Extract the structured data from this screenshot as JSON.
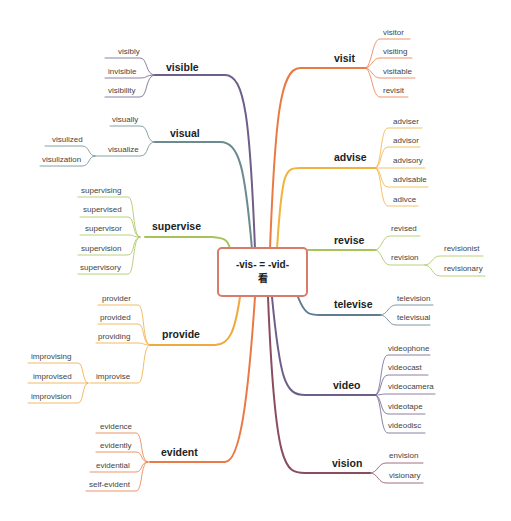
{
  "center": {
    "line1": "-vis- = -vid-",
    "line2": "看"
  },
  "colors": {
    "visible": "#6e5f8a",
    "visual": "#6b8b8f",
    "supervise": "#a6c45a",
    "provide": "#f0a93e",
    "evident": "#ea7a45",
    "visit": "#ea7a45",
    "advise": "#f0b33e",
    "revise": "#a6c45a",
    "televise": "#5f7d8f",
    "video": "#6e5f8a",
    "vision": "#8a4d5f",
    "center_border": "#d97b6c"
  },
  "left": {
    "visible": {
      "label": "visible",
      "children": [
        "visibly",
        "invisible",
        "visibility"
      ]
    },
    "visual": {
      "label": "visual",
      "children": [
        "visually",
        "visualize"
      ],
      "visualize_children": [
        "visulized",
        "visulization"
      ]
    },
    "supervise": {
      "label": "supervise",
      "children": [
        "supervising",
        "supervised",
        "supervisor",
        "supervision",
        "supervisory"
      ]
    },
    "provide": {
      "label": "provide",
      "children": [
        "provider",
        "provided",
        "providing",
        "improvise"
      ],
      "improvise_children": [
        "improvising",
        "improvised",
        "improvision"
      ]
    },
    "evident": {
      "label": "evident",
      "children": [
        "evidence",
        "evidently",
        "evidential",
        "self-evident"
      ]
    }
  },
  "right": {
    "visit": {
      "label": "visit",
      "children": [
        "visitor",
        "visiting",
        "visitable",
        "revisit"
      ]
    },
    "advise": {
      "label": "advise",
      "children": [
        "adviser",
        "advisor",
        "advisory",
        "advisable",
        "adivce"
      ]
    },
    "revise": {
      "label": "revise",
      "children": [
        "revised",
        "revision"
      ],
      "revision_children": [
        "revisionist",
        "revisionary"
      ]
    },
    "televise": {
      "label": "televise",
      "children": [
        "television",
        "televisual"
      ]
    },
    "video": {
      "label": "video",
      "children": [
        "videophone",
        "videocast",
        "videocamera",
        "videotape",
        "videodisc"
      ]
    },
    "vision": {
      "label": "vision",
      "children": [
        "envision",
        "visionary"
      ]
    }
  }
}
